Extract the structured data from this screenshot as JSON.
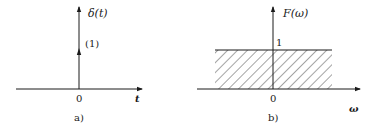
{
  "figure_a": {
    "y_label": "δ(t)",
    "impulse_weight": "(1)",
    "origin": "0",
    "x_label": "t",
    "caption": "a)"
  },
  "figure_b": {
    "y_label": "F(ω)",
    "level_label": "1",
    "origin": "0",
    "x_label": "ω",
    "caption": "b)"
  },
  "colors": {
    "stroke": "#1a1a1a",
    "background": "#ffffff"
  }
}
